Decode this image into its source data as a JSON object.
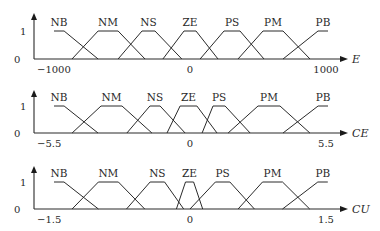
{
  "chart_data": [
    {
      "type": "line",
      "title": "",
      "variable": "E",
      "xlabel": "E",
      "ylabel": "",
      "xlim": [
        -1000,
        1000
      ],
      "ylim": [
        0,
        1
      ],
      "y_ticks": [
        "0",
        "1"
      ],
      "x_ticks": [
        {
          "value": -1000,
          "label": "−1000"
        },
        {
          "value": 0,
          "label": "0"
        },
        {
          "value": 1000,
          "label": "1000"
        }
      ],
      "series": [
        {
          "name": "NB",
          "points": [
            [
              -1000,
              1
            ],
            [
              -926,
              1
            ],
            [
              -676,
              0
            ]
          ]
        },
        {
          "name": "NM",
          "points": [
            [
              -868,
              0
            ],
            [
              -676,
              1
            ],
            [
              -529,
              1
            ],
            [
              -331,
              0
            ]
          ]
        },
        {
          "name": "NS",
          "points": [
            [
              -529,
              0
            ],
            [
              -353,
              1
            ],
            [
              -257,
              1
            ],
            [
              -60,
              0
            ]
          ]
        },
        {
          "name": "ZE",
          "points": [
            [
              -199,
              0
            ],
            [
              -44,
              1
            ],
            [
              44,
              1
            ],
            [
              206,
              0
            ]
          ]
        },
        {
          "name": "PS",
          "points": [
            [
              74,
              0
            ],
            [
              250,
              1
            ],
            [
              368,
              1
            ],
            [
              544,
              0
            ]
          ]
        },
        {
          "name": "PM",
          "points": [
            [
              353,
              0
            ],
            [
              537,
              1
            ],
            [
              684,
              1
            ],
            [
              882,
              0
            ]
          ]
        },
        {
          "name": "PB",
          "points": [
            [
              684,
              0
            ],
            [
              941,
              1
            ],
            [
              1015,
              1
            ]
          ]
        }
      ]
    },
    {
      "type": "line",
      "title": "",
      "variable": "CE",
      "xlabel": "CE",
      "ylabel": "",
      "xlim": [
        -5.5,
        5.5
      ],
      "ylim": [
        0,
        1
      ],
      "y_ticks": [
        "0",
        "1"
      ],
      "x_ticks": [
        {
          "value": -5.5,
          "label": "−5.5"
        },
        {
          "value": 0,
          "label": "0"
        },
        {
          "value": 5.5,
          "label": "5.5"
        }
      ],
      "series": [
        {
          "name": "NB",
          "points": [
            [
              -5.5,
              1
            ],
            [
              -5.09,
              1
            ],
            [
              -3.72,
              0
            ]
          ]
        },
        {
          "name": "NM",
          "points": [
            [
              -4.77,
              0
            ],
            [
              -3.6,
              1
            ],
            [
              -2.75,
              1
            ],
            [
              -1.54,
              0
            ]
          ]
        },
        {
          "name": "NS",
          "points": [
            [
              -2.55,
              0
            ],
            [
              -1.62,
              1
            ],
            [
              -1.21,
              1
            ],
            [
              -0.2,
              0
            ]
          ]
        },
        {
          "name": "ZE",
          "points": [
            [
              -0.93,
              0
            ],
            [
              -0.4,
              1
            ],
            [
              0.28,
              1
            ],
            [
              1.09,
              0
            ]
          ]
        },
        {
          "name": "PS",
          "points": [
            [
              0.49,
              0
            ],
            [
              0.93,
              1
            ],
            [
              1.42,
              1
            ],
            [
              2.43,
              0
            ]
          ]
        },
        {
          "name": "PM",
          "points": [
            [
              1.54,
              0
            ],
            [
              2.75,
              1
            ],
            [
              3.64,
              1
            ],
            [
              4.85,
              0
            ]
          ]
        },
        {
          "name": "PB",
          "points": [
            [
              3.76,
              0
            ],
            [
              5.18,
              1
            ],
            [
              5.58,
              1
            ]
          ]
        }
      ]
    },
    {
      "type": "line",
      "title": "",
      "variable": "CU",
      "xlabel": "CU",
      "ylabel": "",
      "xlim": [
        -1.5,
        1.5
      ],
      "ylim": [
        0,
        1
      ],
      "y_ticks": [
        "0",
        "1"
      ],
      "x_ticks": [
        {
          "value": -1.5,
          "label": "−1.5"
        },
        {
          "value": 0,
          "label": "0"
        },
        {
          "value": 1.5,
          "label": "1.5"
        }
      ],
      "series": [
        {
          "name": "NB",
          "points": [
            [
              -1.5,
              1
            ],
            [
              -1.39,
              1
            ],
            [
              -1.01,
              0
            ]
          ]
        },
        {
          "name": "NM",
          "points": [
            [
              -1.3,
              0
            ],
            [
              -1.01,
              1
            ],
            [
              -0.79,
              1
            ],
            [
              -0.5,
              0
            ]
          ]
        },
        {
          "name": "NS",
          "points": [
            [
              -0.7,
              0
            ],
            [
              -0.44,
              1
            ],
            [
              -0.28,
              1
            ],
            [
              -0.07,
              0
            ]
          ]
        },
        {
          "name": "ZE",
          "points": [
            [
              -0.15,
              0
            ],
            [
              -0.05,
              1
            ],
            [
              0.04,
              1
            ],
            [
              0.14,
              0
            ]
          ]
        },
        {
          "name": "PS",
          "points": [
            [
              0.0,
              0
            ],
            [
              0.28,
              1
            ],
            [
              0.44,
              1
            ],
            [
              0.71,
              0
            ]
          ]
        },
        {
          "name": "PM",
          "points": [
            [
              0.53,
              0
            ],
            [
              0.8,
              1
            ],
            [
              1.02,
              1
            ],
            [
              1.32,
              0
            ]
          ]
        },
        {
          "name": "PB",
          "points": [
            [
              1.02,
              0
            ],
            [
              1.41,
              1
            ],
            [
              1.52,
              1
            ]
          ]
        }
      ]
    }
  ]
}
